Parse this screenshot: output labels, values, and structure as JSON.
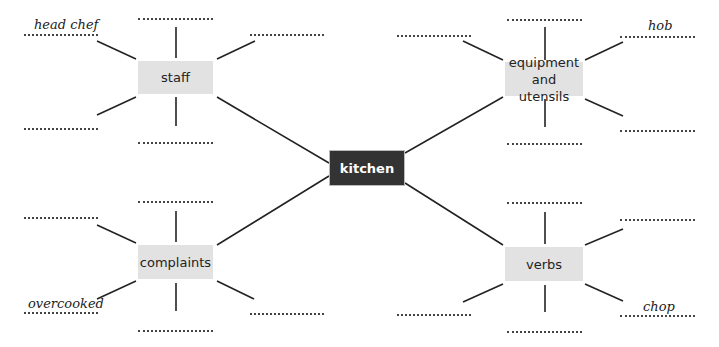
{
  "diagram": {
    "type": "mind-map",
    "center": {
      "label": "kitchen"
    },
    "branches": [
      {
        "id": "staff",
        "label": "staff",
        "example": "head chef"
      },
      {
        "id": "equipment",
        "label": "equipment\nand utensils",
        "example": "hob"
      },
      {
        "id": "complaints",
        "label": "complaints",
        "example": "overcooked"
      },
      {
        "id": "verbs",
        "label": "verbs",
        "example": "chop"
      }
    ]
  },
  "colors": {
    "center_bg": "#333333",
    "branch_bg": "#e2e2e2",
    "line": "#222222"
  }
}
